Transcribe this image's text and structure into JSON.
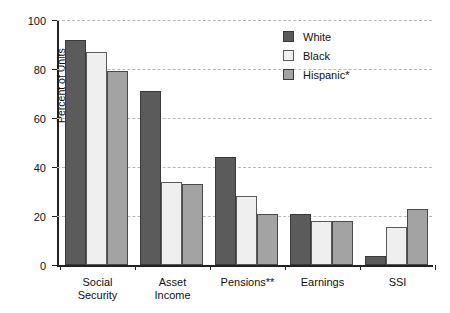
{
  "chart_data": {
    "type": "bar",
    "title": "",
    "xlabel": "",
    "ylabel": "Percent of Units",
    "ylim": [
      0,
      100
    ],
    "yticks": [
      0,
      20,
      40,
      60,
      80,
      100
    ],
    "grid": true,
    "legend_position": "top-right",
    "categories": [
      "Social\nSecurity",
      "Asset\nIncome",
      "Pensions**",
      "Earnings",
      "SSI"
    ],
    "category_lines": [
      [
        "Social",
        "Security"
      ],
      [
        "Asset",
        "Income"
      ],
      [
        "Pensions**"
      ],
      [
        "Earnings"
      ],
      [
        "SSI"
      ]
    ],
    "series": [
      {
        "name": "White",
        "color": "#5b5b5b",
        "values": [
          92,
          71,
          44,
          21,
          3.5
        ]
      },
      {
        "name": "Black",
        "color": "#efefef",
        "values": [
          87,
          34,
          28,
          18,
          15.5
        ]
      },
      {
        "name": "Hispanic*",
        "color": "#a3a3a3",
        "values": [
          79,
          33,
          21,
          18,
          23
        ]
      }
    ]
  },
  "axis": {
    "y_title": "Percent of Units",
    "y_tick_labels": [
      "100",
      "80",
      "60",
      "40",
      "20",
      "0"
    ]
  },
  "legend": {
    "entries": [
      {
        "label": "White"
      },
      {
        "label": "Black"
      },
      {
        "label": "Hispanic*"
      }
    ]
  }
}
